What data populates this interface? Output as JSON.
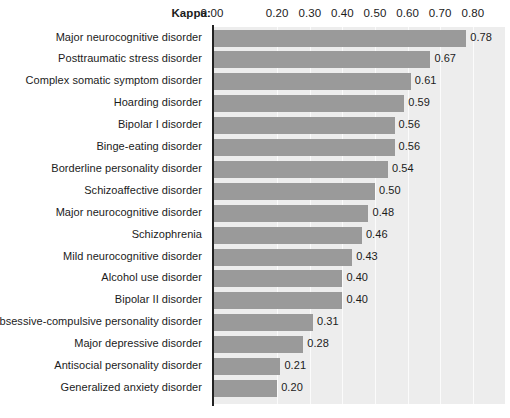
{
  "chart_data": {
    "type": "bar",
    "orientation": "horizontal",
    "title": "",
    "xlabel": "Kappa:",
    "ylabel": "",
    "xlim": [
      0.0,
      0.9
    ],
    "grid": true,
    "legend": null,
    "tick_labels": [
      "0.00",
      "0.20",
      "0.30",
      "0.40",
      "0.50",
      "0.60",
      "0.70",
      "0.80"
    ],
    "tick_values": [
      0.0,
      0.2,
      0.3,
      0.4,
      0.5,
      0.6,
      0.7,
      0.8
    ],
    "categories": [
      "Major neurocognitive disorder",
      "Posttraumatic stress disorder",
      "Complex somatic symptom disorder",
      "Hoarding disorder",
      "Bipolar I disorder",
      "Binge-eating disorder",
      "Borderline personality disorder",
      "Schizoaffective disorder",
      "Major neurocognitive disorder",
      "Schizophrenia",
      "Mild neurocognitive disorder",
      "Alcohol use disorder",
      "Bipolar II disorder",
      "Obsessive-compulsive personality disorder",
      "Major depressive disorder",
      "Antisocial personality disorder",
      "Generalized anxiety disorder"
    ],
    "values": [
      0.78,
      0.67,
      0.61,
      0.59,
      0.56,
      0.56,
      0.54,
      0.5,
      0.48,
      0.46,
      0.43,
      0.4,
      0.4,
      0.31,
      0.28,
      0.21,
      0.2
    ],
    "value_labels": [
      "0.78",
      "0.67",
      "0.61",
      "0.59",
      "0.56",
      "0.56",
      "0.54",
      "0.50",
      "0.48",
      "0.46",
      "0.43",
      "0.40",
      "0.40",
      "0.31",
      "0.28",
      "0.21",
      "0.20"
    ],
    "colors": {
      "bar_fill": "#9a9a9a",
      "plot_background": "#ededed",
      "gridline": "#fbfbfb",
      "axis_line": "#222222",
      "text": "#1b1b1b",
      "page_background": "#ffffff"
    }
  }
}
